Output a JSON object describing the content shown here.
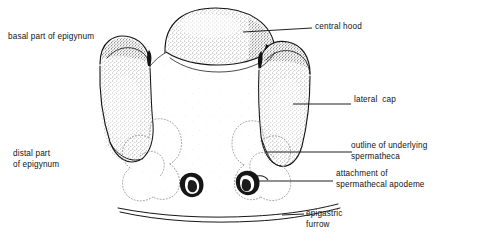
{
  "figure": {
    "subject": "epigynum",
    "style": "line drawing with stipple shading",
    "background_color": "#ffffff",
    "ink_color": "#111111",
    "stipple_color": "#3a3a3a",
    "dotted_outline_color": "#8a8a8a"
  },
  "labels": [
    {
      "id": "basal",
      "text": "basal part of epigynum",
      "position": "upper-left",
      "has_leader_line": false,
      "lines": [
        "basal part of epigynum"
      ]
    },
    {
      "id": "central",
      "text": "central hood",
      "position": "upper-right",
      "has_leader_line": true,
      "lines": [
        "central hood"
      ]
    },
    {
      "id": "lateral",
      "text": "lateral cap",
      "position": "middle-right",
      "has_leader_line": true,
      "lines": [
        "lateral  cap"
      ]
    },
    {
      "id": "outline",
      "text": "outline of underlying spermatheca",
      "position": "lower-right",
      "has_leader_line": true,
      "lines": [
        "outline of underlying",
        "spermatheca"
      ]
    },
    {
      "id": "attachment",
      "text": "attachment of spermathecal apodeme",
      "position": "lower-right",
      "has_leader_line": true,
      "lines": [
        "attachment of",
        "spermathecal apodeme"
      ]
    },
    {
      "id": "distal",
      "text": "distal part of epigynum",
      "position": "lower-left",
      "has_leader_line": false,
      "lines": [
        "distal part",
        "of epigynum"
      ]
    },
    {
      "id": "epigastric",
      "text": "epigastric furrow",
      "position": "bottom-right",
      "has_leader_line": true,
      "lines": [
        "epigastric",
        "furrow"
      ]
    }
  ],
  "anatomy_parts": [
    {
      "name": "central-hood",
      "description": "median dome-shaped hood at top, stippled with dark right margin"
    },
    {
      "name": "lateral-cap-left",
      "description": "left lateral cap, stippled lobe with dark upper rim"
    },
    {
      "name": "lateral-cap-right",
      "description": "right lateral cap, stippled lobe with dark upper rim"
    },
    {
      "name": "basal-part",
      "description": "upper broad region of epigynum"
    },
    {
      "name": "distal-part",
      "description": "lower region of epigynum"
    },
    {
      "name": "spermatheca-outline-left",
      "description": "dotted scalloped outline of underlying left spermatheca"
    },
    {
      "name": "spermatheca-outline-right",
      "description": "dotted scalloped outline of underlying right spermatheca"
    },
    {
      "name": "apodeme-left",
      "description": "small dark kidney-shaped attachment of left spermathecal apodeme"
    },
    {
      "name": "apodeme-right",
      "description": "small dark kidney-shaped attachment of right spermathecal apodeme"
    },
    {
      "name": "epigastric-furrow",
      "description": "pair of gently curved parallel lines below epigynum"
    }
  ]
}
